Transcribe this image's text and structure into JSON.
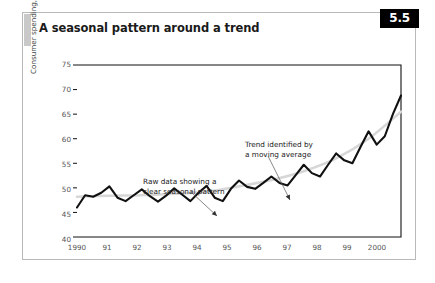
{
  "figure": {
    "title": "A seasonal pattern around a trend",
    "number": "5.5"
  },
  "chart_data": {
    "type": "line",
    "title": "A seasonal pattern around a trend",
    "xlabel": "",
    "ylabel": "Consumer spending, $m",
    "ylim": [
      40,
      75
    ],
    "yticks": [
      40,
      45,
      50,
      55,
      60,
      65,
      70,
      75
    ],
    "xlim": [
      1990,
      2000
    ],
    "xticks": [
      1990,
      1991,
      1992,
      1993,
      1994,
      1995,
      1996,
      1997,
      1998,
      1999,
      2000
    ],
    "xticklabels": [
      "1990",
      "91",
      "92",
      "93",
      "94",
      "95",
      "96",
      "97",
      "98",
      "99",
      "2000"
    ],
    "grid": false,
    "legend": "none",
    "series": [
      {
        "name": "Raw data",
        "color": "#111111",
        "x": [
          1990.0,
          1990.25,
          1990.5,
          1990.75,
          1991.0,
          1991.25,
          1991.5,
          1991.75,
          1992.0,
          1992.25,
          1992.5,
          1992.75,
          1993.0,
          1993.25,
          1993.5,
          1993.75,
          1994.0,
          1994.25,
          1994.5,
          1994.75,
          1995.0,
          1995.25,
          1995.5,
          1995.75,
          1996.0,
          1996.25,
          1996.5,
          1996.75,
          1997.0,
          1997.25,
          1997.5,
          1997.75,
          1998.0,
          1998.25,
          1998.5,
          1998.75,
          1999.0,
          1999.25,
          1999.5,
          1999.75,
          2000.0
        ],
        "values": [
          46.0,
          48.5,
          48.2,
          49.0,
          50.3,
          48.0,
          47.3,
          48.5,
          49.7,
          48.3,
          47.2,
          48.4,
          49.9,
          48.6,
          47.3,
          49.0,
          50.4,
          48.0,
          47.3,
          49.8,
          51.5,
          50.2,
          49.8,
          51.0,
          52.3,
          51.0,
          50.5,
          52.6,
          54.7,
          53.0,
          52.3,
          54.7,
          57.0,
          55.6,
          55.0,
          58.3,
          61.5,
          58.8,
          60.5,
          65.0,
          68.8
        ]
      },
      {
        "name": "Trend identified by a moving average",
        "color": "#d7d7d7",
        "x": [
          1990.0,
          1991.0,
          1992.0,
          1993.0,
          1994.0,
          1995.0,
          1996.0,
          1997.0,
          1998.0,
          1999.0,
          2000.0
        ],
        "values": [
          48.2,
          48.4,
          48.5,
          48.8,
          49.2,
          50.3,
          51.6,
          53.4,
          56.0,
          60.0,
          65.5
        ]
      }
    ],
    "annotations": [
      {
        "id": "raw-data-annotation",
        "line1": "Raw data showing a",
        "line2": "clear seasonal pattern",
        "text_x": 120,
        "text_y": 137,
        "arrow_from_x": 168,
        "arrow_from_y": 145,
        "arrow_to_x": 194,
        "arrow_to_y": 169
      },
      {
        "id": "trend-annotation",
        "line1": "Trend identified by",
        "line2": "a moving average",
        "text_x": 222,
        "text_y": 100,
        "arrow_from_x": 245,
        "arrow_from_y": 109,
        "arrow_to_x": 267,
        "arrow_to_y": 153
      }
    ]
  },
  "axis": {
    "y_ticks": [
      "75",
      "70",
      "65",
      "60",
      "55",
      "50",
      "45",
      "40"
    ],
    "x_ticks": [
      "1990",
      "91",
      "92",
      "93",
      "94",
      "95",
      "96",
      "97",
      "98",
      "99",
      "2000"
    ],
    "y_title": "Consumer spending, $m"
  }
}
